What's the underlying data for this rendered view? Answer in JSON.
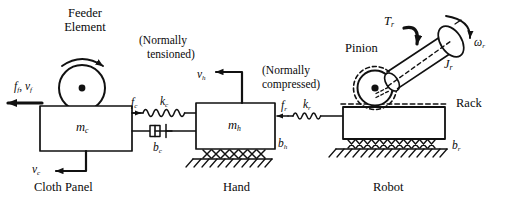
{
  "diagram": {
    "stroke_color": "#111111",
    "background_color": "#ffffff"
  },
  "annotations": {
    "feeder_line1": "Feeder",
    "feeder_line2": "Element",
    "normally_tensioned_line1": "(Normally",
    "normally_tensioned_line2": "tensioned)",
    "normally_compressed_line1": "(Normally",
    "normally_compressed_line2": "compressed)",
    "pinion": "Pinion",
    "rack": "Rack"
  },
  "captions": {
    "cloth_panel": "Cloth Panel",
    "hand": "Hand",
    "robot": "Robot"
  },
  "masses": {
    "cloth": {
      "symbol": "m",
      "subscript": "c"
    },
    "hand": {
      "symbol": "m",
      "subscript": "h"
    }
  },
  "forces": {
    "feeder": {
      "force": "f",
      "force_sub": "f",
      "velocity": "v",
      "velocity_sub": "f",
      "direction": "left"
    },
    "cloth_velocity": {
      "symbol": "v",
      "subscript": "c",
      "direction": "left"
    },
    "cloth_spring_force": {
      "symbol": "f",
      "subscript": "c",
      "direction": "right"
    },
    "hand_velocity": {
      "symbol": "v",
      "subscript": "h",
      "direction": "left"
    },
    "rack_force": {
      "symbol": "f",
      "subscript": "r",
      "direction": "left"
    }
  },
  "springs": {
    "cloth": {
      "symbol": "k",
      "subscript": "c"
    },
    "rack": {
      "symbol": "k",
      "subscript": "r"
    }
  },
  "dampers": {
    "cloth": {
      "symbol": "b",
      "subscript": "c"
    },
    "hand": {
      "symbol": "b",
      "subscript": "h"
    },
    "robot": {
      "symbol": "b",
      "subscript": "r"
    }
  },
  "motor": {
    "torque": {
      "symbol": "T",
      "subscript": "r"
    },
    "inertia": {
      "symbol": "J",
      "subscript": "r"
    },
    "angular_velocity": {
      "symbol": "ω",
      "subscript": "r"
    }
  },
  "icons": {
    "feeder_roller": "rotating-roller-icon",
    "spring": "coil-spring-icon",
    "dashpot": "dashpot-damper-icon",
    "friction_ground": "hatched-ground-icon",
    "pinion_gear": "pinion-gear-icon",
    "motor_cylinder": "motor-cylinder-icon",
    "arrow": "arrow-icon",
    "curved_arrow": "curved-rotation-arrow-icon"
  }
}
